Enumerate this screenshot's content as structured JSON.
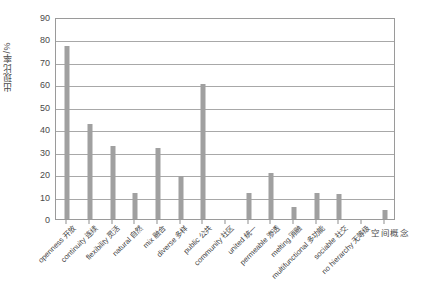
{
  "chart_data": {
    "type": "bar",
    "title": "",
    "xlabel": "空间概念",
    "ylabel": "出现比率/%",
    "ylim": [
      0,
      90
    ],
    "ytick_step": 10,
    "yticks": [
      90,
      80,
      70,
      60,
      50,
      40,
      30,
      20,
      10,
      0
    ],
    "grid": true,
    "legend": false,
    "bar_color": "#a0a0a0",
    "axis_color": "#9a9a9a",
    "gridline_color": "#a8a8a8",
    "categories": [
      "openness 开放",
      "continuity 连续",
      "flexibility 灵活",
      "natural 自然",
      "mix 融合",
      "diverse 多样",
      "public 公共",
      "community 社区",
      "united 统一",
      "permeable 渗透",
      "melting 消融",
      "multifunctional 多功能",
      "sociable 社交",
      "no hierarchy 无等级",
      ""
    ],
    "values": [
      77,
      42.5,
      32.5,
      11.5,
      31.5,
      19,
      60,
      0,
      11.5,
      20.5,
      5.5,
      11.5,
      11,
      0,
      4
    ]
  },
  "axes": {
    "y_title": "出现比率/%",
    "x_title": "空间概念"
  }
}
